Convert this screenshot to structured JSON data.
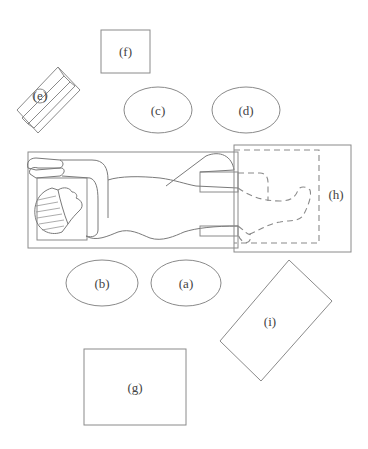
{
  "diagram": {
    "type": "operating-room-layout",
    "patient": {
      "orientation": "supine",
      "head_side": "left",
      "arms": "raised above head"
    },
    "labels": {
      "a": "(a)",
      "b": "(b)",
      "c": "(c)",
      "d": "(d)",
      "e": "(e)",
      "f": "(f)",
      "g": "(g)",
      "h": "(h)",
      "i": "(i)"
    },
    "shapes": {
      "a": "ellipse",
      "b": "ellipse",
      "c": "ellipse",
      "d": "ellipse",
      "e": "tilted-box",
      "f": "square",
      "g": "rectangle",
      "h": "drape-over-lower-body (dashed legs beneath)",
      "i": "tilted-rectangle"
    },
    "colors": {
      "line": "#8a8a8a",
      "text": "#444444",
      "background": "#ffffff"
    }
  }
}
